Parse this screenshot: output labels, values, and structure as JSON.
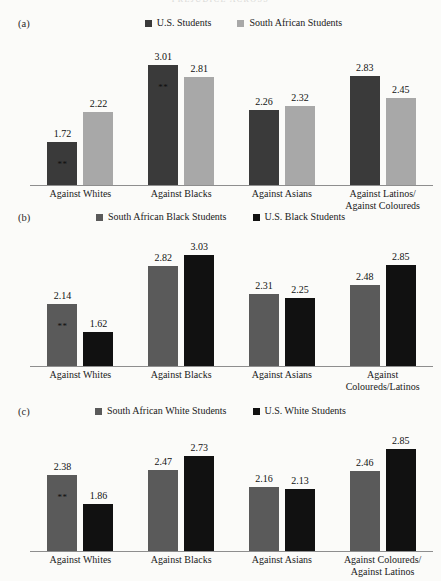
{
  "running_head": "PREJUDICE ACROSS",
  "colors": {
    "us_students": "#3a3a3a",
    "south_african_students": "#a8a8a8",
    "sa_black_students": "#5a5a5a",
    "us_black_students": "#111111",
    "sa_white_students": "#5a5a5a",
    "us_white_students": "#111111",
    "axis": "#8e8e8e",
    "page_background": "#fbfbf9"
  },
  "significance_marker": "**",
  "panels": {
    "a": {
      "label": "(a)",
      "legend": [
        {
          "label": "U.S. Students",
          "color": "#3a3a3a",
          "swatch_name": "legend-swatch-us-students"
        },
        {
          "label": "South African Students",
          "color": "#a8a8a8",
          "swatch_name": "legend-swatch-south-african-students"
        }
      ],
      "categories": [
        {
          "lines": [
            "Against Whites"
          ]
        },
        {
          "lines": [
            "Against Blacks"
          ]
        },
        {
          "lines": [
            "Against Asians"
          ]
        },
        {
          "lines": [
            "Against Latinos/",
            "Against Coloureds"
          ]
        }
      ],
      "bars": [
        [
          {
            "value": "1.72",
            "sig": "**"
          },
          {
            "value": "2.22",
            "sig": ""
          }
        ],
        [
          {
            "value": "3.01",
            "sig": "**"
          },
          {
            "value": "2.81",
            "sig": ""
          }
        ],
        [
          {
            "value": "2.26",
            "sig": ""
          },
          {
            "value": "2.32",
            "sig": ""
          }
        ],
        [
          {
            "value": "2.83",
            "sig": ""
          },
          {
            "value": "2.45",
            "sig": ""
          }
        ]
      ]
    },
    "b": {
      "label": "(b)",
      "legend": [
        {
          "label": "South African Black Students",
          "color": "#5a5a5a",
          "swatch_name": "legend-swatch-sa-black-students"
        },
        {
          "label": "U.S. Black Students",
          "color": "#111111",
          "swatch_name": "legend-swatch-us-black-students"
        }
      ],
      "categories": [
        {
          "lines": [
            "Against Whites"
          ]
        },
        {
          "lines": [
            "Against Blacks"
          ]
        },
        {
          "lines": [
            "Against Asians"
          ]
        },
        {
          "lines": [
            "Against Coloureds/Latinos"
          ]
        }
      ],
      "bars": [
        [
          {
            "value": "2.14",
            "sig": "**"
          },
          {
            "value": "1.62",
            "sig": ""
          }
        ],
        [
          {
            "value": "2.82",
            "sig": ""
          },
          {
            "value": "3.03",
            "sig": ""
          }
        ],
        [
          {
            "value": "2.31",
            "sig": ""
          },
          {
            "value": "2.25",
            "sig": ""
          }
        ],
        [
          {
            "value": "2.48",
            "sig": ""
          },
          {
            "value": "2.85",
            "sig": ""
          }
        ]
      ]
    },
    "c": {
      "label": "(c)",
      "legend": [
        {
          "label": "South African White Students",
          "color": "#5a5a5a",
          "swatch_name": "legend-swatch-sa-white-students"
        },
        {
          "label": "U.S. White Students",
          "color": "#111111",
          "swatch_name": "legend-swatch-us-white-students"
        }
      ],
      "categories": [
        {
          "lines": [
            "Against Whites"
          ]
        },
        {
          "lines": [
            "Against Blacks"
          ]
        },
        {
          "lines": [
            "Against Asians"
          ]
        },
        {
          "lines": [
            "Against Coloureds/",
            "Against Latinos"
          ]
        }
      ],
      "bars": [
        [
          {
            "value": "2.38",
            "sig": "**"
          },
          {
            "value": "1.86",
            "sig": ""
          }
        ],
        [
          {
            "value": "2.47",
            "sig": ""
          },
          {
            "value": "2.73",
            "sig": ""
          }
        ],
        [
          {
            "value": "2.16",
            "sig": ""
          },
          {
            "value": "2.13",
            "sig": ""
          }
        ],
        [
          {
            "value": "2.46",
            "sig": ""
          },
          {
            "value": "2.85",
            "sig": ""
          }
        ]
      ]
    }
  },
  "chart_data": [
    {
      "type": "bar",
      "panel": "(a)",
      "title": "",
      "xlabel": "",
      "ylabel": "",
      "categories": [
        "Against Whites",
        "Against Blacks",
        "Against Asians",
        "Against Latinos/Against Coloureds"
      ],
      "series": [
        {
          "name": "U.S. Students",
          "values": [
            1.72,
            3.01,
            2.26,
            2.83
          ],
          "color": "#3a3a3a"
        },
        {
          "name": "South African Students",
          "values": [
            2.22,
            2.81,
            2.32,
            2.45
          ],
          "color": "#a8a8a8"
        }
      ],
      "annotations": [
        {
          "series": "U.S. Students",
          "category": "Against Whites",
          "text": "**"
        },
        {
          "series": "U.S. Students",
          "category": "Against Blacks",
          "text": "**"
        }
      ],
      "ylim": [
        1.0,
        3.4
      ],
      "grid": false,
      "legend_position": "top"
    },
    {
      "type": "bar",
      "panel": "(b)",
      "title": "",
      "xlabel": "",
      "ylabel": "",
      "categories": [
        "Against Whites",
        "Against Blacks",
        "Against Asians",
        "Against Coloureds/Latinos"
      ],
      "series": [
        {
          "name": "South African Black Students",
          "values": [
            2.14,
            2.82,
            2.31,
            2.48
          ],
          "color": "#5a5a5a"
        },
        {
          "name": "U.S. Black Students",
          "values": [
            1.62,
            3.03,
            2.25,
            2.85
          ],
          "color": "#111111"
        }
      ],
      "annotations": [
        {
          "series": "South African Black Students",
          "category": "Against Whites",
          "text": "**"
        }
      ],
      "ylim": [
        1.0,
        3.4
      ],
      "grid": false,
      "legend_position": "top"
    },
    {
      "type": "bar",
      "panel": "(c)",
      "title": "",
      "xlabel": "",
      "ylabel": "",
      "categories": [
        "Against Whites",
        "Against Blacks",
        "Against Asians",
        "Against Coloureds/Against Latinos"
      ],
      "series": [
        {
          "name": "South African White Students",
          "values": [
            2.38,
            2.47,
            2.16,
            2.46
          ],
          "color": "#5a5a5a"
        },
        {
          "name": "U.S. White Students",
          "values": [
            1.86,
            2.73,
            2.13,
            2.85
          ],
          "color": "#111111"
        }
      ],
      "annotations": [
        {
          "series": "South African White Students",
          "category": "Against Whites",
          "text": "**"
        }
      ],
      "ylim": [
        1.0,
        3.4
      ],
      "grid": false,
      "legend_position": "top"
    }
  ]
}
